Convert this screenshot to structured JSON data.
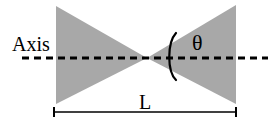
{
  "figure": {
    "background_color": "#ffffff",
    "line_color": "#000000",
    "fill_color": "#a8a8a8",
    "width": 275,
    "height": 125
  },
  "labels": {
    "axis": "Axis",
    "angle": "θ",
    "length": "L"
  },
  "icons": {
    "axis_line": "dashed-axis-line",
    "angle_arc": "angle-arc",
    "dimension_line": "dimension-line-with-end-caps",
    "left_cone": "left-shaded-triangle",
    "right_cone": "right-shaded-triangle"
  },
  "geometry": {
    "vertex": {
      "x": 147,
      "y": 58
    },
    "left_triangle_points": "56,6 56,104 147,58",
    "right_triangle_points": "236,5 236,104 147,58",
    "axis_line": {
      "x1": 22,
      "y1": 58,
      "x2": 268,
      "y2": 58,
      "dash": "7,5",
      "width": 3
    },
    "angle_arc_path": "M 176,33 C 167,43 167,71 176,80",
    "dimension_line": {
      "x1": 54,
      "y1": 112,
      "x2": 236,
      "y2": 112
    },
    "cap_half_height": 5,
    "axis_label_pos": {
      "x": 12,
      "y": 51
    },
    "angle_label_pos": {
      "x": 192,
      "y": 50
    },
    "length_label_pos": {
      "x": 145,
      "y": 109
    }
  }
}
